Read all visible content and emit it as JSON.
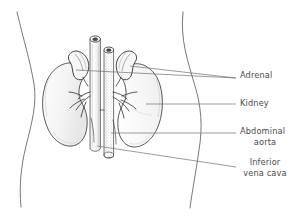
{
  "figure": {
    "type": "anatomical-line-illustration",
    "background_color": "#ffffff",
    "ink_color": "#3a3a3a",
    "label_color": "#4a4a4a",
    "leader_color": "#707070"
  },
  "labels": [
    {
      "id": "adrenal",
      "text": "Adrenal",
      "x": 240,
      "y": 78
    },
    {
      "id": "kidney",
      "text": "Kidney",
      "x": 240,
      "y": 106
    },
    {
      "id": "aorta_l1",
      "text": "Abdominal",
      "x": 240,
      "y": 134
    },
    {
      "id": "aorta_l2",
      "text": "aorta",
      "x": 265,
      "y": 145
    },
    {
      "id": "ivc_l1",
      "text": "Inferior",
      "x": 265,
      "y": 165
    },
    {
      "id": "ivc_l2",
      "text": "vena cava",
      "x": 265,
      "y": 176
    }
  ],
  "structures": [
    {
      "id": "body-outline",
      "name": "torso outline"
    },
    {
      "id": "left-kidney",
      "name": "kidney (viewer left)"
    },
    {
      "id": "right-kidney",
      "name": "kidney (viewer right)"
    },
    {
      "id": "left-adrenal-gland",
      "name": "adrenal gland (viewer left)"
    },
    {
      "id": "right-adrenal-gland",
      "name": "adrenal gland (viewer right)"
    },
    {
      "id": "inferior-vena-cava",
      "name": "inferior vena cava"
    },
    {
      "id": "abdominal-aorta",
      "name": "abdominal aorta"
    },
    {
      "id": "renal-vessels",
      "name": "renal arteries and veins"
    }
  ]
}
